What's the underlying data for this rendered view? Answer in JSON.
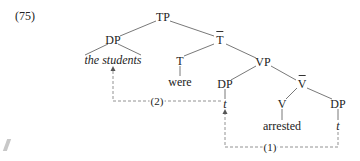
{
  "example": {
    "number": "(75)"
  },
  "tree": {
    "nodes": {
      "tp": {
        "label": "TP",
        "x": 163,
        "y": 17
      },
      "dp_subject": {
        "label": "DP",
        "x": 113,
        "y": 40
      },
      "subject_text": {
        "label": "the students",
        "x": 113,
        "y": 60,
        "italic": true
      },
      "t_bar": {
        "label": "T",
        "x": 220,
        "y": 40,
        "bar": true
      },
      "t_head": {
        "label": "T",
        "x": 180,
        "y": 61
      },
      "were": {
        "label": "were",
        "x": 180,
        "y": 82
      },
      "vp": {
        "label": "VP",
        "x": 263,
        "y": 62
      },
      "dp_spec_vp": {
        "label": "DP",
        "x": 225,
        "y": 84
      },
      "trace_spec": {
        "label": "t",
        "x": 225,
        "y": 104,
        "italic": true
      },
      "v_bar": {
        "label": "V",
        "x": 302,
        "y": 84,
        "bar": true
      },
      "v_head": {
        "label": "V",
        "x": 282,
        "y": 104
      },
      "dp_object": {
        "label": "DP",
        "x": 338,
        "y": 104
      },
      "arrested": {
        "label": "arrested",
        "x": 282,
        "y": 126
      },
      "trace_object": {
        "label": "t",
        "x": 338,
        "y": 126,
        "italic": true
      }
    },
    "edges": [
      [
        "tp",
        "dp_subject"
      ],
      [
        "tp",
        "t_bar"
      ],
      [
        "t_bar",
        "t_head"
      ],
      [
        "t_bar",
        "vp"
      ],
      [
        "vp",
        "dp_spec_vp"
      ],
      [
        "vp",
        "v_bar"
      ],
      [
        "v_bar",
        "v_head"
      ],
      [
        "v_bar",
        "dp_object"
      ]
    ]
  },
  "movements": [
    {
      "label": "(2)",
      "label_x": 157,
      "label_y": 101,
      "from": "trace_spec",
      "to": "subject_text"
    },
    {
      "label": "(1)",
      "label_x": 270,
      "label_y": 147,
      "from": "trace_object",
      "to": "trace_spec"
    }
  ],
  "colors": {
    "line": "#555555",
    "dashed": "#777777",
    "text": "#222222"
  }
}
